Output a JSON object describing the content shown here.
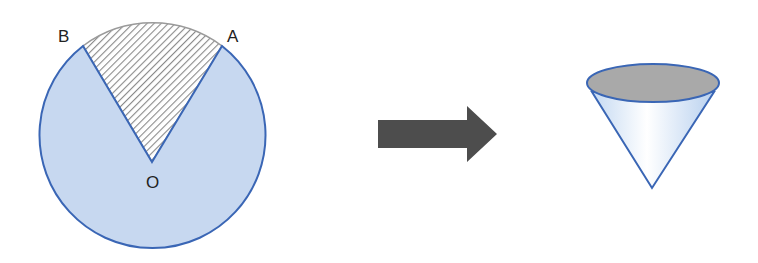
{
  "diagram": {
    "labels": {
      "point_a": "A",
      "point_b": "B",
      "center_o": "O"
    },
    "colors": {
      "circle_fill": "#c7d8f0",
      "circle_stroke": "#3a66b5",
      "hatch": "#8a8a8a",
      "arrow": "#4d4d4d",
      "cone_top": "#a9a9a9",
      "cone_body_light": "#ffffff",
      "cone_body_blue": "#c4d9f2"
    },
    "elements": [
      "circle-with-removed-sector",
      "transform-arrow",
      "cone"
    ]
  }
}
